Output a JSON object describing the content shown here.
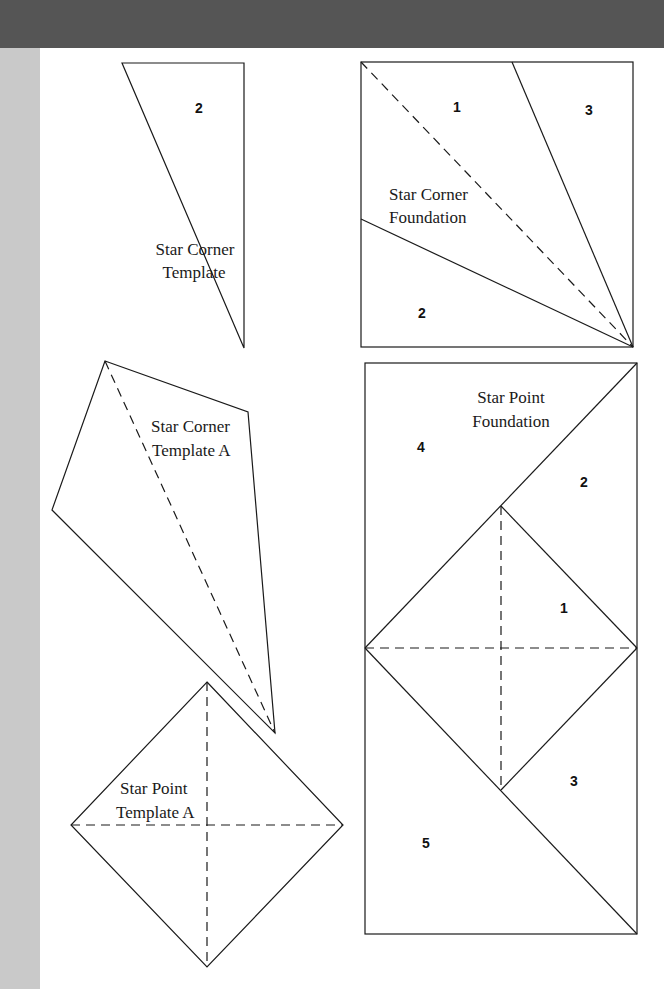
{
  "page": {
    "header_color": "#555555",
    "side_strip_color": "#c9c9c9"
  },
  "pieces": {
    "star_corner_template": {
      "label_line1": "Star Corner",
      "label_line2": "Template",
      "numbers": [
        "2"
      ]
    },
    "star_corner_foundation": {
      "label_line1": "Star Corner",
      "label_line2": "Foundation",
      "numbers": [
        "1",
        "2",
        "3"
      ]
    },
    "star_corner_template_a": {
      "label_line1": "Star Corner",
      "label_line2": "Template A"
    },
    "star_point_template_a": {
      "label_line1": "Star Point",
      "label_line2": "Template A"
    },
    "star_point_foundation": {
      "label_line1": "Star Point",
      "label_line2": "Foundation",
      "numbers": [
        "1",
        "2",
        "3",
        "4",
        "5"
      ]
    }
  }
}
